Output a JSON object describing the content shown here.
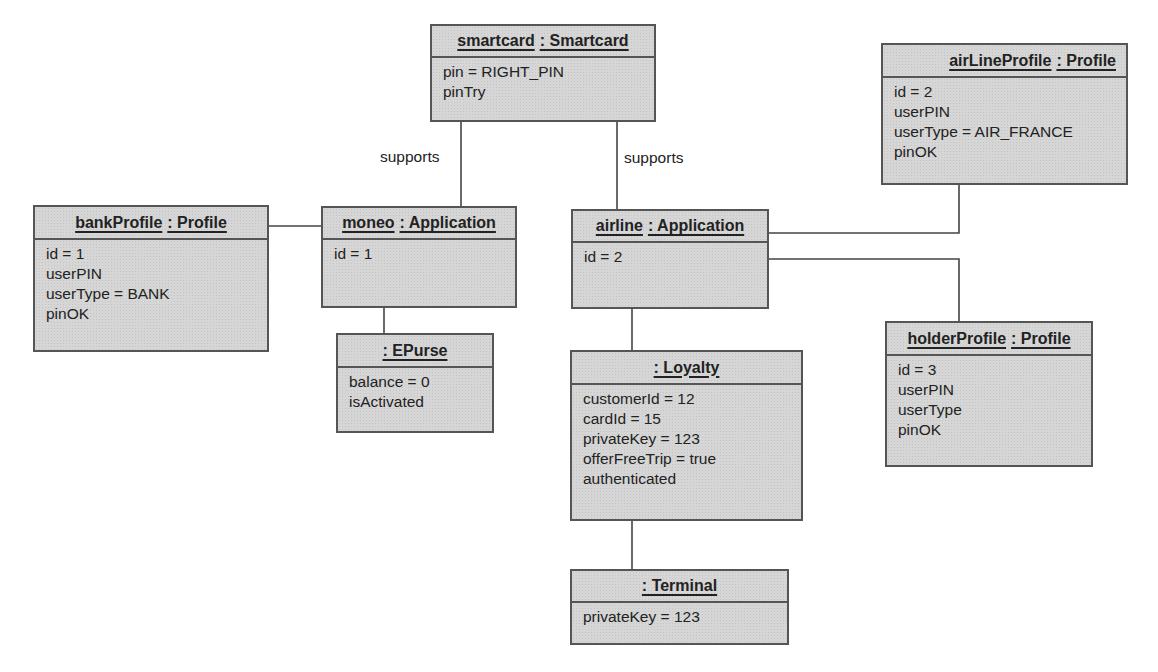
{
  "diagram_type": "UML object diagram",
  "objects": {
    "smartcard": {
      "name": "smartcard",
      "class": ": Smartcard",
      "attributes": [
        "pin = RIGHT_PIN",
        "pinTry"
      ]
    },
    "airLineProfile": {
      "name": "airLineProfile",
      "class": ": Profile",
      "attributes": [
        "id = 2",
        "userPIN",
        "userType = AIR_FRANCE",
        "pinOK"
      ]
    },
    "bankProfile": {
      "name": "bankProfile",
      "class": ": Profile",
      "attributes": [
        "id = 1",
        "userPIN",
        "userType = BANK",
        "pinOK"
      ]
    },
    "moneo": {
      "name": "moneo",
      "class": ": Application",
      "attributes": [
        "id = 1"
      ]
    },
    "airline": {
      "name": "airline",
      "class": ": Application",
      "attributes": [
        "id = 2"
      ]
    },
    "epurse": {
      "name": "",
      "class": ": EPurse",
      "attributes": [
        "balance = 0",
        "isActivated"
      ]
    },
    "loyalty": {
      "name": "",
      "class": ": Loyalty",
      "attributes": [
        "customerId = 12",
        "cardId = 15",
        "privateKey = 123",
        "offerFreeTrip = true",
        "authenticated"
      ]
    },
    "terminal": {
      "name": "",
      "class": ": Terminal",
      "attributes": [
        "privateKey = 123"
      ]
    },
    "holderProfile": {
      "name": "holderProfile",
      "class": ": Profile",
      "attributes": [
        "id = 3",
        "userPIN",
        "userType",
        "pinOK"
      ]
    }
  },
  "links": [
    {
      "from": "smartcard",
      "to": "moneo",
      "label": "supports"
    },
    {
      "from": "smartcard",
      "to": "airline",
      "label": "supports"
    },
    {
      "from": "bankProfile",
      "to": "moneo",
      "label": ""
    },
    {
      "from": "moneo",
      "to": "epurse",
      "label": ""
    },
    {
      "from": "airline",
      "to": "airLineProfile",
      "label": ""
    },
    {
      "from": "airline",
      "to": "holderProfile",
      "label": ""
    },
    {
      "from": "airline",
      "to": "loyalty",
      "label": ""
    },
    {
      "from": "loyalty",
      "to": "terminal",
      "label": ""
    }
  ],
  "colors": {
    "box_fill": "#d6d6d6",
    "box_border": "#555555",
    "line": "#444444",
    "text": "#222222"
  }
}
